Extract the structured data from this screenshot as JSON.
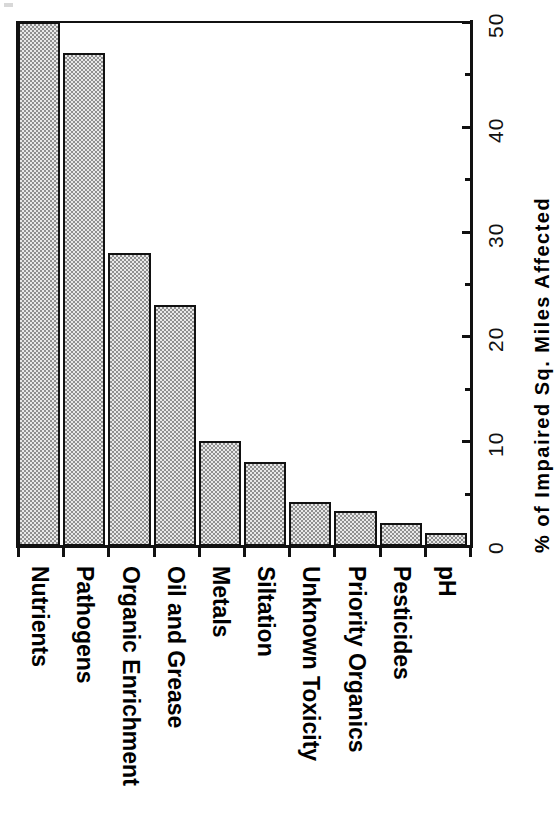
{
  "chart_data": {
    "type": "bar",
    "orientation": "vertical-bars-rotated-90",
    "title": "",
    "subtitle": "",
    "xlabel": "",
    "ylabel": "% of Impaired Sq. Miles Affected",
    "ylim": [
      0,
      50
    ],
    "ytick_labels": [
      "0",
      "10",
      "20",
      "30",
      "40",
      "50"
    ],
    "ytick_values": [
      0,
      10,
      20,
      30,
      40,
      50
    ],
    "yminor_tick_values": [
      5,
      15,
      25,
      35,
      45
    ],
    "grid": false,
    "legend": null,
    "categories": [
      "Nutrients",
      "Pathogens",
      "Organic Enrichment",
      "Oil and Grease",
      "Metals",
      "Siltation",
      "Unknown Toxicity",
      "Priority Organics",
      "Pesticides",
      "pH"
    ],
    "values": [
      50,
      47,
      28,
      23,
      10,
      8,
      4.2,
      3.3,
      2.2,
      1.2
    ],
    "bar_fill_color": "#b9b9b9",
    "bar_edge_color": "#111111",
    "axis_color": "#111111",
    "background_color": "#ffffff"
  },
  "axis": {
    "value_axis_title": "% of Impaired Sq. Miles Affected",
    "tick_labels": [
      "0",
      "10",
      "20",
      "30",
      "40",
      "50"
    ]
  }
}
